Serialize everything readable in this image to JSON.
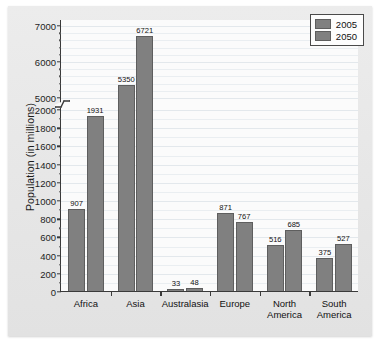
{
  "chart_data": {
    "type": "bar",
    "title": "",
    "xlabel": "",
    "ylabel": "Population (in millions)",
    "categories": [
      "Africa",
      "Asia",
      "Australasia",
      "Europe",
      "North\nAmerica",
      "South\nAmerica"
    ],
    "series": [
      {
        "name": "2005",
        "values": [
          907,
          5350,
          33,
          871,
          516,
          375
        ]
      },
      {
        "name": "2050",
        "values": [
          1931,
          6721,
          48,
          767,
          685,
          527
        ]
      }
    ],
    "ylim": [
      0,
      7000
    ],
    "axis_break": {
      "from": 2000,
      "to": 5000
    },
    "yticks": [
      0,
      200,
      400,
      600,
      800,
      1000,
      1200,
      1400,
      1600,
      1800,
      2000,
      5000,
      6000,
      7000
    ],
    "ytick_labels": [
      "0",
      "200",
      "400",
      "600",
      "800",
      "1000",
      "1200",
      "1400",
      "1600",
      "1800",
      "2000",
      "5000",
      "6000",
      "7000"
    ],
    "grid": true,
    "legend_position": "top-right",
    "bar_color": "#808080",
    "bar_edge_color": "#5e5e5e",
    "plot_background": "#fbfbfb",
    "figure_background": "#e8e8e8",
    "axis_color": "#3a3a3a",
    "data_labels": [
      "907",
      "1931",
      "5350",
      "6721",
      "33",
      "48",
      "871",
      "767",
      "516",
      "685",
      "375",
      "527"
    ]
  },
  "legend": {
    "items": [
      {
        "label": "2005",
        "swatch_name": "legend-swatch-2005"
      },
      {
        "label": "2050",
        "swatch_name": "legend-swatch-2050"
      }
    ]
  },
  "caption": {
    "text": ""
  }
}
